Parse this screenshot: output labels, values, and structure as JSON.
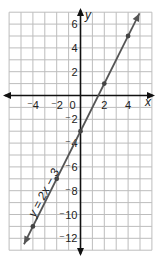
{
  "chart_data": {
    "type": "line",
    "title": "",
    "xlabel": "x",
    "ylabel": "y",
    "xlim": [
      -6,
      6
    ],
    "ylim": [
      -13,
      7
    ],
    "grid": true,
    "x_ticks": [
      -4,
      -2,
      0,
      2,
      4
    ],
    "y_ticks": [
      6,
      4,
      2,
      -2,
      -4,
      -6,
      -8,
      -10,
      -12
    ],
    "x_tick_labels": [
      "⁻4",
      "⁻2",
      "0",
      "2",
      "4"
    ],
    "y_tick_labels": [
      "6",
      "4",
      "2",
      "⁻2",
      "⁻4",
      "⁻6",
      "⁻8",
      "⁻10",
      "⁻12"
    ],
    "series": [
      {
        "name": "y = 2x − 3",
        "equation": "y = 2x - 3",
        "points": [
          [
            -4,
            -11
          ],
          [
            -2,
            -7
          ],
          [
            0,
            -3
          ],
          [
            2,
            1
          ],
          [
            4,
            5
          ]
        ],
        "color": "#555555"
      }
    ],
    "annotations": [
      {
        "text": "y = 2x − 3",
        "x": -3.5,
        "y": -8.5,
        "rotation": -63
      }
    ]
  },
  "labels": {
    "x_axis": "x",
    "y_axis": "y",
    "line_label": "y = 2x − 3",
    "x_ticks": [
      "⁻4",
      "⁻2",
      "0",
      "2",
      "4"
    ],
    "y_ticks": [
      "6",
      "4",
      "2",
      "⁻2",
      "⁻4",
      "⁻6",
      "⁻8",
      "⁻10",
      "⁻12"
    ]
  }
}
